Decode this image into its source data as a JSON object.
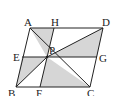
{
  "figure": {
    "type": "parallelogram-geometry",
    "vertices": [
      "A",
      "B",
      "C",
      "D"
    ],
    "points": {
      "A": "A",
      "B": "B",
      "C": "C",
      "D": "D",
      "E": "E",
      "F": "F",
      "G": "G",
      "H": "H",
      "P": "P"
    },
    "segments": [
      "AB",
      "BC",
      "CD",
      "DA",
      "EG",
      "HF",
      "AC",
      "BD"
    ],
    "shaded_triangles": [
      "AHP",
      "EBP",
      "PFC",
      "PDG"
    ],
    "colors": {
      "shade": "#d6d6d6",
      "line": "#222222"
    }
  }
}
